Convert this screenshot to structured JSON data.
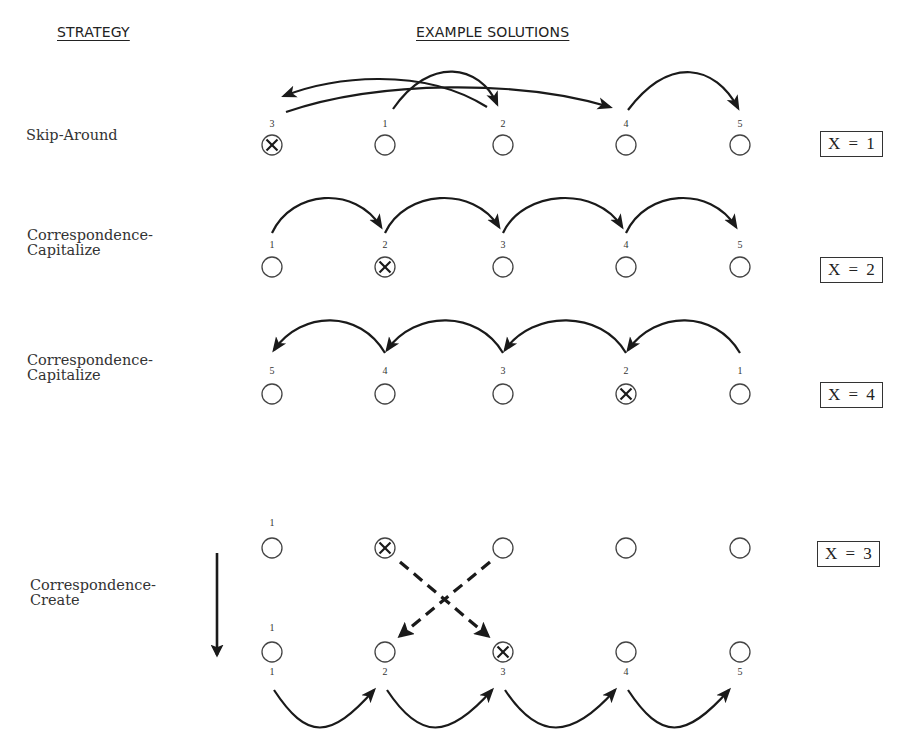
{
  "headers": {
    "strategy": "STRATEGY",
    "examples": "EXAMPLE SOLUTIONS"
  },
  "rows": [
    {
      "strategy": "Skip-Around",
      "x_label": "X = 1",
      "marked_position": 1,
      "order_labels": [
        "3",
        "1",
        "2",
        "4",
        "5"
      ],
      "sequence": [
        2,
        3,
        1,
        4,
        5
      ]
    },
    {
      "strategy": "Correspondence-\nCapitalize",
      "x_label": "X = 2",
      "marked_position": 2,
      "order_labels": [
        "1",
        "2",
        "3",
        "4",
        "5"
      ],
      "sequence": [
        1,
        2,
        3,
        4,
        5
      ]
    },
    {
      "strategy": "Correspondence-\nCapitalize",
      "x_label": "X = 4",
      "marked_position": 4,
      "order_labels": [
        "5",
        "4",
        "3",
        "2",
        "1"
      ],
      "sequence": [
        5,
        4,
        3,
        2,
        1
      ]
    },
    {
      "strategy": "Correspondence-\nCreate",
      "x_label": "X = 3",
      "top_marked_position": 2,
      "bottom_marked_position": 3,
      "top_labels": [
        "1",
        "",
        "",
        "",
        ""
      ],
      "bottom_labels_above": [
        "1",
        "",
        "",
        "",
        ""
      ],
      "bottom_labels_below": [
        "1",
        "2",
        "3",
        "4",
        "5"
      ],
      "swap": {
        "from_top": 2,
        "to_bottom": 3,
        "from_top_b": 3,
        "to_bottom_b": 2
      }
    }
  ],
  "icons": {
    "marked_circle": "circled-x-icon",
    "empty_circle": "circle-icon",
    "down_arrow": "down-arrow-icon"
  }
}
